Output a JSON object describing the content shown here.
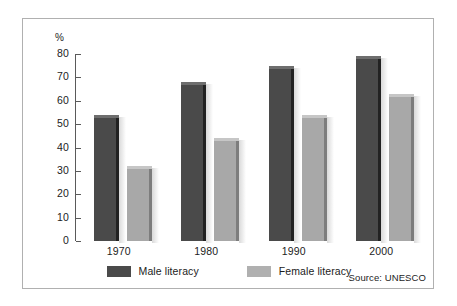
{
  "chart_data": {
    "type": "bar",
    "title": "",
    "subtitle": "",
    "xlabel": "",
    "ylabel": "%",
    "ylim": [
      0,
      80
    ],
    "yticks": [
      0,
      10,
      20,
      30,
      40,
      50,
      60,
      70,
      80
    ],
    "ytick_labels": [
      "0",
      "10",
      "20",
      "30",
      "40",
      "50",
      "60",
      "70",
      "80"
    ],
    "grid": false,
    "legend_position": "bottom-center",
    "categories": [
      "1970",
      "1980",
      "1990",
      "2000"
    ],
    "series": [
      {
        "name": "Male literacy",
        "color": "#4a4a4a",
        "values": [
          54,
          68,
          75,
          79
        ]
      },
      {
        "name": "Female literacy",
        "color": "#a8a8a8",
        "values": [
          32,
          44,
          54,
          63
        ]
      }
    ],
    "annotations": [
      "Source: UNESCO"
    ]
  },
  "axis": {
    "unit_label": "%"
  },
  "legend": {
    "items": [
      {
        "label": "Male literacy",
        "swatch": "male"
      },
      {
        "label": "Female literacy",
        "swatch": "female"
      }
    ]
  },
  "footer": {
    "source": "Source: UNESCO"
  },
  "colors": {
    "male_bar": "#4a4a4a",
    "female_bar": "#a8a8a8",
    "frame_border": "#b0b0b0",
    "axis_line": "#5a5a5a",
    "text": "#1c1c1c",
    "background": "#ffffff"
  }
}
